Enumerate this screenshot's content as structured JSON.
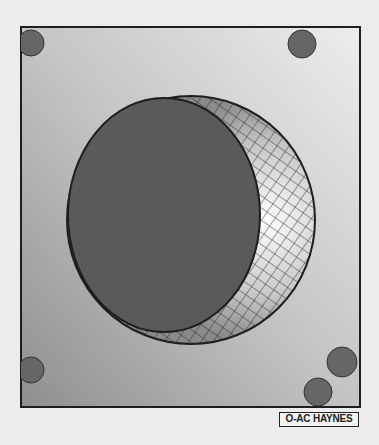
{
  "figure": {
    "label": "O-AC HAYNES",
    "colors": {
      "background": "#ececec",
      "panel_gradient_start": "#9a9a9a",
      "panel_gradient_end": "#e8e8e8",
      "disc": "#5a5a5a",
      "dots": "#666666",
      "outline": "#1e1e1e"
    }
  }
}
